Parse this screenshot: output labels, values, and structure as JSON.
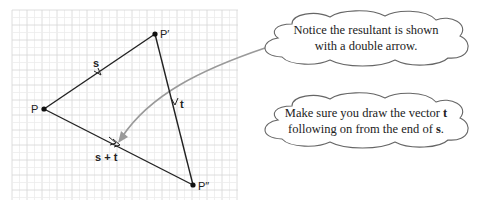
{
  "diagram": {
    "type": "vector-addition-triangle",
    "grid": {
      "x": 12,
      "y": 10,
      "width": 226,
      "height": 190,
      "minor_step": 7.5,
      "major_every": 2,
      "minor_color": "#ececec",
      "major_color": "#d6d6d6"
    },
    "points": [
      {
        "id": "P",
        "label": "P",
        "x": 44,
        "y": 109
      },
      {
        "id": "P1",
        "label": "P′",
        "x": 155,
        "y": 34
      },
      {
        "id": "P2",
        "label": "P″",
        "x": 193,
        "y": 185
      }
    ],
    "vectors": [
      {
        "id": "s",
        "label": "s",
        "from": "P",
        "to": "P1",
        "arrow": "single"
      },
      {
        "id": "t",
        "label": "t",
        "from": "P1",
        "to": "P2",
        "arrow": "single"
      },
      {
        "id": "s_plus_t",
        "label": "s + t",
        "from": "P",
        "to": "P2",
        "arrow": "double"
      }
    ],
    "colors": {
      "line": "#222222",
      "pointer": "#999999",
      "cloud_stroke": "#666666"
    }
  },
  "notes": [
    {
      "id": "note-resultant",
      "lines": [
        [
          {
            "text": "Notice the resultant is shown"
          }
        ],
        [
          {
            "text": "with a double arrow."
          }
        ]
      ]
    },
    {
      "id": "note-vector-t",
      "lines": [
        [
          {
            "text": "Make sure you draw the vector "
          },
          {
            "text": "t",
            "bold": true
          }
        ],
        [
          {
            "text": "following on from the end of "
          },
          {
            "text": "s",
            "bold": true
          },
          {
            "text": "."
          }
        ]
      ]
    }
  ],
  "labels": {
    "P": "P",
    "P1": "P′",
    "P2": "P″",
    "s": "s",
    "t": "t",
    "s_plus_t": "s + t",
    "note1_line1": "Notice the resultant is shown",
    "note1_line2": "with a double arrow.",
    "note2_line1_a": "Make sure you draw the vector ",
    "note2_line1_b": "t",
    "note2_line2_a": "following on from the end of ",
    "note2_line2_b": "s",
    "note2_line2_c": "."
  }
}
